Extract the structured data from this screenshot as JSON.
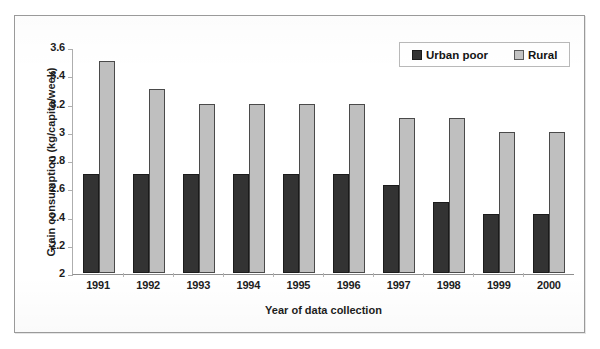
{
  "chart_data": {
    "type": "bar",
    "title": "",
    "xlabel": "Year of data collection",
    "ylabel": "Grain consumption (kg/capita/week)",
    "categories": [
      "1991",
      "1992",
      "1993",
      "1994",
      "1995",
      "1996",
      "1997",
      "1998",
      "1999",
      "2000"
    ],
    "series": [
      {
        "name": "Urban poor",
        "color": "#333333",
        "values": [
          2.7,
          2.7,
          2.7,
          2.7,
          2.7,
          2.7,
          2.62,
          2.5,
          2.42,
          2.42
        ]
      },
      {
        "name": "Rural",
        "color": "#bfbfbf",
        "values": [
          3.5,
          3.3,
          3.2,
          3.2,
          3.2,
          3.2,
          3.1,
          3.1,
          3.0,
          3.0
        ]
      }
    ],
    "ylim": [
      2,
      3.6
    ],
    "ytick_step": 0.2,
    "yticks": [
      "3.6",
      "3.4",
      "3.2",
      "3",
      "2.8",
      "2.6",
      "2.4",
      "2.2",
      "2"
    ],
    "grid": false,
    "legend_position": "top-right"
  },
  "legend": {
    "items": [
      {
        "label": "Urban poor",
        "swatch": "urban"
      },
      {
        "label": "Rural",
        "swatch": "rural"
      }
    ]
  }
}
